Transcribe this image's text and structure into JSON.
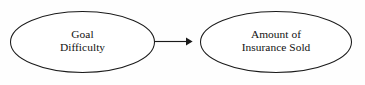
{
  "diagram": {
    "type": "path-diagram",
    "background_color": "#fefefe",
    "stroke_color": "#1a1a1a",
    "text_color": "#111111",
    "nodes": [
      {
        "id": "goal-difficulty",
        "shape": "ellipse",
        "lines": [
          "Goal",
          "Difficulty"
        ],
        "line1": "Goal",
        "line2": "Difficulty",
        "center_x": 82.5,
        "center_y": 42,
        "radius_x": 72.5,
        "radius_y": 31
      },
      {
        "id": "amount-of-insurance-sold",
        "shape": "ellipse",
        "lines": [
          "Amount of",
          "Insurance Sold"
        ],
        "line1": "Amount of",
        "line2": "Insurance Sold",
        "center_x": 276,
        "center_y": 42,
        "radius_x": 76,
        "radius_y": 31
      }
    ],
    "edges": [
      {
        "id": "goal-to-insurance",
        "from": "goal-difficulty",
        "to": "amount-of-insurance-sold",
        "style": "solid",
        "arrowhead": "filled-triangle",
        "label": "",
        "x1": 155,
        "x2": 192,
        "y": 41.5
      }
    ]
  }
}
